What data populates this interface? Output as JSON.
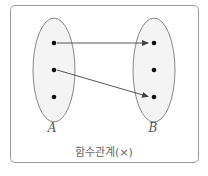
{
  "diagram": {
    "type": "mapping",
    "caption": "함수관계(×)",
    "sets": [
      {
        "name": "A",
        "elements": 3
      },
      {
        "name": "B",
        "elements": 3
      }
    ],
    "mappings": [
      {
        "from": "A.1",
        "to": "B.1"
      },
      {
        "from": "A.2",
        "to": "B.3"
      }
    ],
    "colors": {
      "border": "#9a9a9a",
      "ellipse_stroke": "#888888",
      "ellipse_fill": "#f4f4f4",
      "dot": "#111111",
      "arrow": "#444444"
    }
  }
}
